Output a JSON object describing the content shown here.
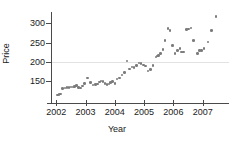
{
  "chart_data": {
    "type": "scatter",
    "title": "",
    "xlabel": "Year",
    "ylabel": "Price",
    "xlim": [
      2001.82,
      2007.9
    ],
    "ylim": [
      100,
      330
    ],
    "xticks": [
      2002,
      2003,
      2004,
      2005,
      2006,
      2007
    ],
    "xtick_labels": [
      "2002",
      "2003",
      "2004",
      "2005",
      "2006",
      "2007"
    ],
    "yticks": [
      150,
      200,
      250,
      300
    ],
    "ytick_labels": [
      "150",
      "200",
      "250",
      "300"
    ],
    "grid": "horizontal gridline at y=200 only",
    "legend": "none",
    "marker": {
      "shape": "circle",
      "color": "#7b7b7b",
      "size_px": 2.6
    },
    "axis_color": "#4a4a4a",
    "gridline_color": "#e2e2e2",
    "background": "#ffffff",
    "n_points": 68,
    "series": [
      {
        "name": "Price",
        "points": [
          [
            2002.04,
            113
          ],
          [
            2002.09,
            114
          ],
          [
            2002.14,
            116
          ],
          [
            2002.21,
            130
          ],
          [
            2002.3,
            131
          ],
          [
            2002.37,
            133
          ],
          [
            2002.43,
            133
          ],
          [
            2002.5,
            134
          ],
          [
            2002.57,
            134
          ],
          [
            2002.63,
            136
          ],
          [
            2002.7,
            138
          ],
          [
            2002.76,
            132
          ],
          [
            2002.83,
            131
          ],
          [
            2002.9,
            137
          ],
          [
            2002.97,
            143
          ],
          [
            3003.04,
            158
          ],
          [
            2003.07,
            158
          ],
          [
            2003.17,
            146
          ],
          [
            2003.26,
            139
          ],
          [
            2003.33,
            140
          ],
          [
            2003.4,
            142
          ],
          [
            2003.47,
            147
          ],
          [
            2003.53,
            150
          ],
          [
            2003.6,
            148
          ],
          [
            2003.67,
            143
          ],
          [
            2003.73,
            141
          ],
          [
            2003.8,
            142
          ],
          [
            2003.86,
            145
          ],
          [
            2003.93,
            148
          ],
          [
            2004.0,
            143
          ],
          [
            2004.08,
            155
          ],
          [
            2004.16,
            157
          ],
          [
            2004.24,
            165
          ],
          [
            2004.33,
            172
          ],
          [
            2004.41,
            202
          ],
          [
            2004.5,
            181
          ],
          [
            2004.58,
            186
          ],
          [
            2004.66,
            185
          ],
          [
            2004.75,
            190
          ],
          [
            2004.83,
            197
          ],
          [
            2004.9,
            196
          ],
          [
            2004.97,
            192
          ],
          [
            2005.05,
            189
          ],
          [
            2005.13,
            176
          ],
          [
            2005.21,
            180
          ],
          [
            2005.3,
            190
          ],
          [
            2005.4,
            212
          ],
          [
            2005.45,
            215
          ],
          [
            2005.5,
            217
          ],
          [
            2005.57,
            222
          ],
          [
            2005.64,
            232
          ],
          [
            2005.72,
            255
          ],
          [
            2005.82,
            287
          ],
          [
            2005.88,
            282
          ],
          [
            2005.96,
            243
          ],
          [
            2006.06,
            222
          ],
          [
            2006.15,
            230
          ],
          [
            2006.22,
            234
          ],
          [
            2006.28,
            225
          ],
          [
            2006.35,
            225
          ],
          [
            2006.45,
            284
          ],
          [
            2006.52,
            286
          ],
          [
            2006.6,
            288
          ],
          [
            2006.69,
            255
          ],
          [
            2006.83,
            222
          ],
          [
            2006.9,
            229
          ],
          [
            2006.97,
            230
          ],
          [
            2007.05,
            234
          ],
          [
            2007.18,
            252
          ],
          [
            2007.3,
            281
          ],
          [
            2007.45,
            318
          ]
        ]
      }
    ]
  }
}
